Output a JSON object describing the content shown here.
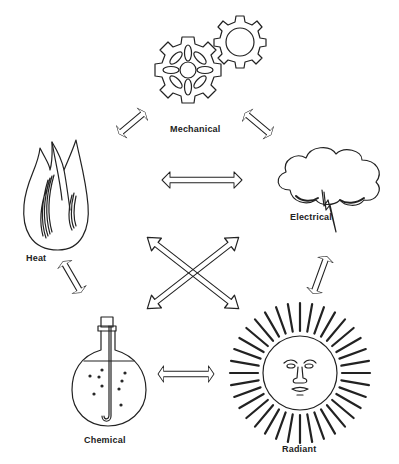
{
  "diagram": {
    "nodes": [
      {
        "id": "mechanical",
        "label": "Mechanical",
        "icon": "gears-icon"
      },
      {
        "id": "electrical",
        "label": "Electrical",
        "icon": "storm-cloud-lightning-icon"
      },
      {
        "id": "radiant",
        "label": "Radiant",
        "icon": "sun-face-icon"
      },
      {
        "id": "chemical",
        "label": "Chemical",
        "icon": "flask-icon"
      },
      {
        "id": "heat",
        "label": "Heat",
        "icon": "flame-icon"
      }
    ],
    "edges": [
      {
        "from": "mechanical",
        "to": "heat",
        "type": "bidirectional"
      },
      {
        "from": "mechanical",
        "to": "electrical",
        "type": "bidirectional"
      },
      {
        "from": "heat",
        "to": "electrical",
        "type": "bidirectional"
      },
      {
        "from": "heat",
        "to": "chemical",
        "type": "bidirectional"
      },
      {
        "from": "electrical",
        "to": "radiant",
        "type": "bidirectional"
      },
      {
        "from": "chemical",
        "to": "radiant",
        "type": "bidirectional"
      },
      {
        "from": "heat",
        "to": "radiant",
        "type": "bidirectional"
      },
      {
        "from": "electrical",
        "to": "chemical",
        "type": "bidirectional"
      }
    ],
    "colors": {
      "stroke": "#222222",
      "background": "#ffffff"
    }
  }
}
